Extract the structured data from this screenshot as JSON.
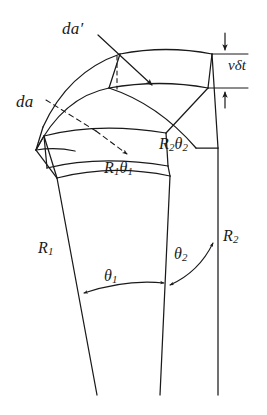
{
  "figure": {
    "kind": "technical-line-diagram",
    "background_color": "#ffffff",
    "line_color": "#1a1a1a",
    "labels": {
      "da_prime": {
        "base": "da",
        "prime": "′"
      },
      "da": {
        "base": "da"
      },
      "v_delta_t": {
        "text": "vδt"
      },
      "arc_inner": {
        "base": "R",
        "sub1": "1",
        "sym": "θ",
        "sub2": "1"
      },
      "arc_outer": {
        "base": "R",
        "sub1": "2",
        "sym": "θ",
        "sub2": "2"
      },
      "radius_inner": {
        "base": "R",
        "sub": "1"
      },
      "radius_outer": {
        "base": "R",
        "sub": "2"
      },
      "angle_inner": {
        "sym": "θ",
        "sub": "1"
      },
      "angle_outer": {
        "sym": "θ",
        "sub": "2"
      }
    }
  }
}
